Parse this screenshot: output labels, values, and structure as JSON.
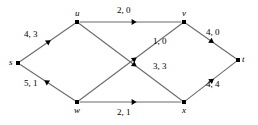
{
  "diagram": {
    "type": "flow-network",
    "nodes": [
      {
        "id": "s",
        "label": "s",
        "x": 18,
        "y": 63,
        "label_dx": -9,
        "label_dy": -5
      },
      {
        "id": "u",
        "label": "u",
        "x": 77,
        "y": 22,
        "label_dx": -2,
        "label_dy": -13
      },
      {
        "id": "v",
        "label": "v",
        "x": 184,
        "y": 22,
        "label_dx": -2,
        "label_dy": -13
      },
      {
        "id": "w",
        "label": "w",
        "x": 77,
        "y": 102,
        "label_dx": -3,
        "label_dy": 4
      },
      {
        "id": "x",
        "label": "x",
        "x": 184,
        "y": 102,
        "label_dx": -2,
        "label_dy": 4
      },
      {
        "id": "t",
        "label": "t",
        "x": 238,
        "y": 60,
        "label_dx": 4,
        "label_dy": -5
      }
    ],
    "edges": [
      {
        "id": "s-u",
        "from": "s",
        "to": "u",
        "label": "4, 3",
        "capacity": 4,
        "flow": 3,
        "label_x": 24,
        "label_y": 30
      },
      {
        "id": "w-s",
        "from": "w",
        "to": "s",
        "label": "5, 1",
        "capacity": 5,
        "flow": 1,
        "label_x": 24,
        "label_y": 79
      },
      {
        "id": "u-v",
        "from": "u",
        "to": "v",
        "label": "2, 0",
        "capacity": 2,
        "flow": 0,
        "label_x": 117,
        "label_y": 6
      },
      {
        "id": "u-x",
        "from": "u",
        "to": "x",
        "label": "3, 3",
        "capacity": 3,
        "flow": 3,
        "label_x": 153,
        "label_y": 62
      },
      {
        "id": "w-v",
        "from": "w",
        "to": "v",
        "label": "1, 0",
        "capacity": 1,
        "flow": 0,
        "label_x": 153,
        "label_y": 37
      },
      {
        "id": "w-x",
        "from": "w",
        "to": "x",
        "label": "2, 1",
        "capacity": 2,
        "flow": 1,
        "label_x": 117,
        "label_y": 108
      },
      {
        "id": "v-t",
        "from": "v",
        "to": "t",
        "label": "4, 0",
        "capacity": 4,
        "flow": 0,
        "label_x": 206,
        "label_y": 28
      },
      {
        "id": "x-t",
        "from": "x",
        "to": "t",
        "label": "4, 4",
        "capacity": 4,
        "flow": 4,
        "label_x": 206,
        "label_y": 80
      }
    ],
    "colors": {
      "edge": "#6b6b6b",
      "node": "#000000",
      "text": "#000000",
      "background": "#ffffff"
    }
  }
}
